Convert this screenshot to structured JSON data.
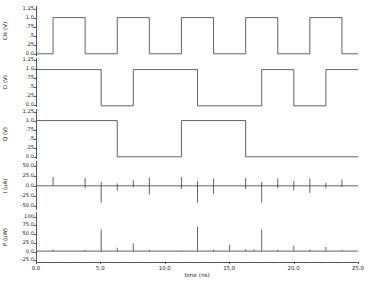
{
  "chart_data": {
    "type": "line",
    "title": "",
    "xlabel": "time (ns)",
    "xlim": [
      0.0,
      25.0
    ],
    "xticks": [
      0.0,
      5.0,
      10.0,
      15.0,
      20.0,
      25.0
    ],
    "xticklabels": [
      "0.0",
      "5.0",
      "10.0",
      "15.0",
      "20.0",
      "25.0"
    ],
    "grid": false,
    "legend": "none",
    "panels": [
      {
        "name": "clk",
        "ylabel": "Clk (V)",
        "ylim": [
          -0.05,
          1.32
        ],
        "yticks": [
          0.0,
          0.25,
          0.5,
          0.75,
          1.0,
          1.25
        ],
        "yticklabels": [
          "0.0",
          ".25",
          ".5",
          ".75",
          "1.0",
          "1.25"
        ],
        "series": [
          {
            "name": "Clk",
            "x": [
              0.0,
              1.25,
              1.25,
              3.75,
              3.75,
              6.25,
              6.25,
              8.75,
              8.75,
              11.25,
              11.25,
              13.75,
              13.75,
              16.25,
              16.25,
              18.75,
              18.75,
              21.25,
              21.25,
              23.75,
              23.75,
              25.0
            ],
            "y": [
              0.0,
              0.0,
              1.0,
              1.0,
              0.0,
              0.0,
              1.0,
              1.0,
              0.0,
              0.0,
              1.0,
              1.0,
              0.0,
              0.0,
              1.0,
              1.0,
              0.0,
              0.0,
              1.0,
              1.0,
              0.0,
              0.0
            ]
          }
        ]
      },
      {
        "name": "d",
        "ylabel": "D (V)",
        "ylim": [
          -0.05,
          1.32
        ],
        "yticks": [
          0.0,
          0.25,
          0.5,
          0.75,
          1.0,
          1.25
        ],
        "yticklabels": [
          "0.0",
          ".25",
          ".5",
          ".75",
          "1.0",
          "1.25"
        ],
        "series": [
          {
            "name": "D",
            "x": [
              0.0,
              5.0,
              5.0,
              7.5,
              7.5,
              12.5,
              12.5,
              17.5,
              17.5,
              20.0,
              20.0,
              22.5,
              22.5,
              25.0
            ],
            "y": [
              1.0,
              1.0,
              0.0,
              0.0,
              1.0,
              1.0,
              0.0,
              0.0,
              1.0,
              1.0,
              0.0,
              0.0,
              1.0,
              1.0
            ]
          }
        ]
      },
      {
        "name": "q",
        "ylabel": "Q (V)",
        "ylim": [
          -0.05,
          1.32
        ],
        "yticks": [
          0.0,
          0.25,
          0.5,
          0.75,
          1.0,
          1.25
        ],
        "yticklabels": [
          "0.0",
          ".25",
          ".5",
          ".75",
          "1.0",
          "1.25"
        ],
        "series": [
          {
            "name": "Q",
            "x": [
              0.0,
              6.25,
              6.25,
              11.25,
              11.25,
              16.25,
              16.25,
              25.0
            ],
            "y": [
              1.0,
              1.0,
              0.0,
              0.0,
              1.0,
              1.0,
              0.0,
              0.0
            ]
          }
        ]
      },
      {
        "name": "current",
        "ylabel": "I (uA)",
        "ylim": [
          -62.0,
          62.0
        ],
        "yticks": [
          -50.0,
          -25.0,
          0.0,
          25.0,
          50.0
        ],
        "yticklabels": [
          "-50.0",
          "-25.0",
          "0.0",
          "25.0",
          "50.0"
        ],
        "spikes": [
          {
            "t": 1.25,
            "up": 22.0,
            "down": 0.0
          },
          {
            "t": 3.75,
            "up": 20.0,
            "down": -6.0
          },
          {
            "t": 5.0,
            "up": 10.0,
            "down": -42.0
          },
          {
            "t": 6.25,
            "up": 6.0,
            "down": -12.0
          },
          {
            "t": 7.5,
            "up": 14.0,
            "down": -4.0
          },
          {
            "t": 8.75,
            "up": 20.0,
            "down": -22.0
          },
          {
            "t": 11.25,
            "up": 22.0,
            "down": -8.0
          },
          {
            "t": 12.5,
            "up": 12.0,
            "down": -42.0
          },
          {
            "t": 13.75,
            "up": 18.0,
            "down": -20.0
          },
          {
            "t": 16.25,
            "up": 20.0,
            "down": -8.0
          },
          {
            "t": 17.5,
            "up": 10.0,
            "down": -42.0
          },
          {
            "t": 18.75,
            "up": 18.0,
            "down": -6.0
          },
          {
            "t": 20.0,
            "up": 12.0,
            "down": -12.0
          },
          {
            "t": 21.25,
            "up": 18.0,
            "down": -18.0
          },
          {
            "t": 22.5,
            "up": 8.0,
            "down": -6.0
          },
          {
            "t": 23.75,
            "up": 16.0,
            "down": -4.0
          }
        ]
      },
      {
        "name": "power",
        "ylabel": "P (uW)",
        "ylim": [
          -30.0,
          112.0
        ],
        "yticks": [
          -25.0,
          0.0,
          25.0,
          50.0,
          75.0,
          100.0
        ],
        "yticklabels": [
          "-25.0",
          "0.0",
          "25.0",
          "50.0",
          "75.0",
          "100"
        ],
        "spikes": [
          {
            "t": 1.25,
            "h": 4.0
          },
          {
            "t": 3.75,
            "h": 3.0
          },
          {
            "t": 5.0,
            "h": 62.0
          },
          {
            "t": 6.25,
            "h": 10.0
          },
          {
            "t": 7.5,
            "h": 22.0
          },
          {
            "t": 8.75,
            "h": 4.0
          },
          {
            "t": 11.25,
            "h": 2.0
          },
          {
            "t": 12.5,
            "h": 70.0
          },
          {
            "t": 13.75,
            "h": 4.0
          },
          {
            "t": 15.0,
            "h": 18.0
          },
          {
            "t": 16.25,
            "h": 6.0
          },
          {
            "t": 16.9,
            "h": 5.0
          },
          {
            "t": 17.5,
            "h": 62.0
          },
          {
            "t": 18.75,
            "h": 4.0
          },
          {
            "t": 20.0,
            "h": 16.0
          },
          {
            "t": 21.25,
            "h": 4.0
          },
          {
            "t": 22.5,
            "h": 12.0
          },
          {
            "t": 23.75,
            "h": 3.0
          }
        ]
      }
    ]
  },
  "colors": {
    "trace": "#3b3b3b",
    "axis": "#555555",
    "text": "#222222",
    "background": "#ffffff"
  }
}
